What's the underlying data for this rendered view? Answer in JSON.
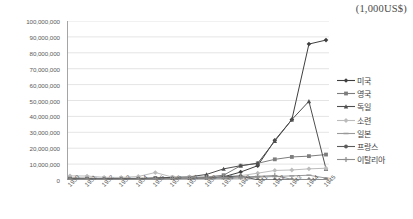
{
  "chart_data": {
    "type": "line",
    "title": "(1,000US$)",
    "xlabel": "",
    "ylabel": "",
    "ylim": [
      0,
      100000000
    ],
    "ytick_step": 10000000,
    "grid": true,
    "legend_position": "right",
    "categories": [
      "1930",
      "1931",
      "1932",
      "1933",
      "1934",
      "1935",
      "1936",
      "1937",
      "1938",
      "1939",
      "1940",
      "1941",
      "1942",
      "1943",
      "1944",
      "1945"
    ],
    "ytick_labels": [
      "0",
      "10,000,000",
      "20,000,000",
      "30,000,000",
      "40,000,000",
      "50,000,000",
      "60,000,000",
      "70,000,000",
      "80,000,000",
      "90,000,000",
      "100,000,000"
    ],
    "ytick_values": [
      0,
      10000000,
      20000000,
      30000000,
      40000000,
      50000000,
      60000000,
      70000000,
      80000000,
      90000000,
      100000000
    ],
    "series": [
      {
        "name": "미국",
        "color": "#3f3f3f",
        "marker": "diamond",
        "values": [
          600000,
          500000,
          400000,
          500000,
          600000,
          700000,
          900000,
          1000000,
          1100000,
          2000000,
          5000000,
          9000000,
          25000000,
          38000000,
          85500000,
          88000000
        ]
      },
      {
        "name": "영국",
        "color": "#7d7d7d",
        "marker": "square",
        "values": [
          1300000,
          1200000,
          1000000,
          1000000,
          1100000,
          1300000,
          1500000,
          1600000,
          1900000,
          3000000,
          9000000,
          10500000,
          13000000,
          14500000,
          15000000,
          16000000
        ]
      },
      {
        "name": "독일",
        "color": "#4f4f4f",
        "marker": "triangle",
        "values": [
          500000,
          500000,
          400000,
          600000,
          800000,
          1200000,
          1700000,
          2000000,
          3500000,
          7000000,
          9000000,
          10500000,
          24500000,
          38000000,
          49500000,
          7000000
        ]
      },
      {
        "name": "소련",
        "color": "#bcbcbc",
        "marker": "cross-diamond",
        "values": [
          2600000,
          2500000,
          1700000,
          1600000,
          2200000,
          4700000,
          1800000,
          1800000,
          1700000,
          2000000,
          2700000,
          4300000,
          6000000,
          6300000,
          7000000,
          7400000
        ]
      },
      {
        "name": "일본",
        "color": "#9a9a9a",
        "marker": "dash",
        "values": [
          300000,
          300000,
          300000,
          400000,
          400000,
          500000,
          500000,
          600000,
          700000,
          900000,
          1200000,
          1800000,
          2200000,
          2600000,
          3000000,
          1200000
        ]
      },
      {
        "name": "프랑스",
        "color": "#5c5c5c",
        "marker": "filled-circle",
        "values": [
          900000,
          800000,
          700000,
          700000,
          800000,
          900000,
          1000000,
          1100000,
          1400000,
          2000000,
          2500000,
          100000,
          100000,
          100000,
          100000,
          100000
        ]
      },
      {
        "name": "이탈리아",
        "color": "#8e8e8e",
        "marker": "plus",
        "values": [
          500000,
          500000,
          400000,
          400000,
          500000,
          700000,
          900000,
          1000000,
          1200000,
          1500000,
          1800000,
          2300000,
          2800000,
          400000,
          300000,
          200000
        ]
      }
    ]
  }
}
